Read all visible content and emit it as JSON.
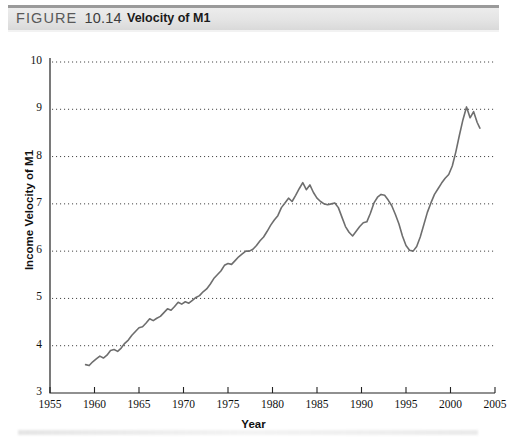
{
  "header": {
    "figure_label": "FIGURE",
    "figure_number": "10.14",
    "title": "Velocity of M1"
  },
  "chart_data": {
    "type": "line",
    "title": "Velocity of M1",
    "xlabel": "Year",
    "ylabel": "Income Velocity of M1",
    "xlim": [
      1955,
      2005
    ],
    "ylim": [
      3,
      10
    ],
    "xticks": [
      1955,
      1960,
      1965,
      1970,
      1975,
      1980,
      1985,
      1990,
      1995,
      2000,
      2005
    ],
    "yticks": [
      3,
      4,
      5,
      6,
      7,
      8,
      9,
      10
    ],
    "grid": "horizontal-dotted",
    "legend": "none",
    "line_color": "#6e6e6e",
    "series": [
      {
        "name": "Income Velocity of M1",
        "x": [
          1959.0,
          1959.4,
          1959.8,
          1960.2,
          1960.6,
          1961.0,
          1961.4,
          1961.8,
          1962.2,
          1962.6,
          1963.0,
          1963.4,
          1963.8,
          1964.2,
          1964.6,
          1965.0,
          1965.4,
          1965.8,
          1966.2,
          1966.6,
          1967.0,
          1967.4,
          1967.8,
          1968.2,
          1968.6,
          1969.0,
          1969.4,
          1969.8,
          1970.2,
          1970.6,
          1971.0,
          1971.4,
          1971.8,
          1972.2,
          1972.6,
          1973.0,
          1973.4,
          1973.8,
          1974.2,
          1974.6,
          1975.0,
          1975.4,
          1975.8,
          1976.2,
          1976.6,
          1977.0,
          1977.4,
          1977.8,
          1978.2,
          1978.6,
          1979.0,
          1979.4,
          1979.8,
          1980.2,
          1980.6,
          1981.0,
          1981.4,
          1981.8,
          1982.2,
          1982.6,
          1983.0,
          1983.4,
          1983.8,
          1984.2,
          1984.6,
          1985.0,
          1985.4,
          1985.8,
          1986.2,
          1986.6,
          1987.0,
          1987.4,
          1987.8,
          1988.2,
          1988.6,
          1989.0,
          1989.4,
          1989.8,
          1990.2,
          1990.6,
          1991.0,
          1991.4,
          1991.8,
          1992.2,
          1992.6,
          1993.0,
          1993.4,
          1993.8,
          1994.2,
          1994.6,
          1995.0,
          1995.4,
          1995.8,
          1996.2,
          1996.6,
          1997.0,
          1997.4,
          1997.8,
          1998.2,
          1998.6,
          1999.0,
          1999.4,
          1999.8,
          2000.2,
          2000.6,
          2001.0,
          2001.4,
          2001.8,
          2002.2,
          2002.6,
          2003.0,
          2003.3
        ],
        "y": [
          3.6,
          3.58,
          3.66,
          3.72,
          3.78,
          3.74,
          3.8,
          3.9,
          3.92,
          3.88,
          3.95,
          4.05,
          4.12,
          4.22,
          4.3,
          4.38,
          4.4,
          4.48,
          4.57,
          4.53,
          4.58,
          4.62,
          4.7,
          4.78,
          4.75,
          4.83,
          4.92,
          4.88,
          4.93,
          4.9,
          4.96,
          5.02,
          5.06,
          5.14,
          5.2,
          5.3,
          5.42,
          5.5,
          5.58,
          5.7,
          5.74,
          5.72,
          5.8,
          5.88,
          5.94,
          6.0,
          6.0,
          6.04,
          6.12,
          6.22,
          6.3,
          6.42,
          6.55,
          6.66,
          6.75,
          6.92,
          7.02,
          7.12,
          7.05,
          7.18,
          7.32,
          7.45,
          7.3,
          7.4,
          7.24,
          7.12,
          7.05,
          7.0,
          6.98,
          7.0,
          7.02,
          6.92,
          6.72,
          6.52,
          6.4,
          6.32,
          6.42,
          6.52,
          6.6,
          6.62,
          6.8,
          7.02,
          7.14,
          7.2,
          7.18,
          7.08,
          6.96,
          6.78,
          6.58,
          6.32,
          6.12,
          6.02,
          6.0,
          6.1,
          6.3,
          6.56,
          6.82,
          7.02,
          7.2,
          7.32,
          7.44,
          7.54,
          7.62,
          7.8,
          8.1,
          8.45,
          8.78,
          9.05,
          8.82,
          8.95,
          8.72,
          8.6
        ]
      }
    ]
  }
}
